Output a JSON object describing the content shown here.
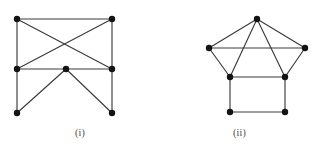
{
  "figure": {
    "background_color": "#ffffff",
    "edge_color": "#3b3b3b",
    "vertex_color": "#131313",
    "caption_color": "#4a4a4a",
    "vertex_radius": 3.2,
    "edge_width": 1.15,
    "panels": [
      {
        "id": "graph-i",
        "caption": "(i)",
        "vertex_count": 7,
        "edge_count": 11,
        "vertices": [
          {
            "name": "top-left",
            "x": 17,
            "y": 19
          },
          {
            "name": "top-right",
            "x": 112,
            "y": 19
          },
          {
            "name": "mid-left",
            "x": 17,
            "y": 69
          },
          {
            "name": "mid-center",
            "x": 66,
            "y": 69
          },
          {
            "name": "mid-right",
            "x": 112,
            "y": 69
          },
          {
            "name": "bottom-left",
            "x": 17,
            "y": 113
          },
          {
            "name": "bottom-right",
            "x": 112,
            "y": 113
          }
        ],
        "edges": [
          {
            "from": "top-left",
            "to": "top-right"
          },
          {
            "from": "top-left",
            "to": "mid-left"
          },
          {
            "from": "top-right",
            "to": "mid-right"
          },
          {
            "from": "top-left",
            "to": "mid-right"
          },
          {
            "from": "top-right",
            "to": "mid-left"
          },
          {
            "from": "mid-left",
            "to": "mid-center"
          },
          {
            "from": "mid-center",
            "to": "mid-right"
          },
          {
            "from": "mid-left",
            "to": "bottom-left"
          },
          {
            "from": "mid-right",
            "to": "bottom-right"
          },
          {
            "from": "mid-center",
            "to": "bottom-left"
          },
          {
            "from": "mid-center",
            "to": "bottom-right"
          }
        ]
      },
      {
        "id": "graph-ii",
        "caption": "(ii)",
        "vertex_count": 7,
        "edge_count": 11,
        "vertices": [
          {
            "name": "apex",
            "x": 97,
            "y": 19
          },
          {
            "name": "left-wing",
            "x": 49,
            "y": 48
          },
          {
            "name": "right-wing",
            "x": 145,
            "y": 48
          },
          {
            "name": "square-top-left",
            "x": 70,
            "y": 77
          },
          {
            "name": "square-top-right",
            "x": 125,
            "y": 77
          },
          {
            "name": "square-bottom-left",
            "x": 70,
            "y": 112
          },
          {
            "name": "square-bottom-right",
            "x": 125,
            "y": 112
          }
        ],
        "edges": [
          {
            "from": "apex",
            "to": "left-wing"
          },
          {
            "from": "apex",
            "to": "right-wing"
          },
          {
            "from": "apex",
            "to": "square-top-left"
          },
          {
            "from": "apex",
            "to": "square-top-right"
          },
          {
            "from": "left-wing",
            "to": "right-wing"
          },
          {
            "from": "left-wing",
            "to": "square-top-left"
          },
          {
            "from": "right-wing",
            "to": "square-top-right"
          },
          {
            "from": "square-top-left",
            "to": "square-top-right"
          },
          {
            "from": "square-top-left",
            "to": "square-bottom-left"
          },
          {
            "from": "square-top-right",
            "to": "square-bottom-right"
          },
          {
            "from": "square-bottom-left",
            "to": "square-bottom-right"
          }
        ]
      }
    ]
  }
}
